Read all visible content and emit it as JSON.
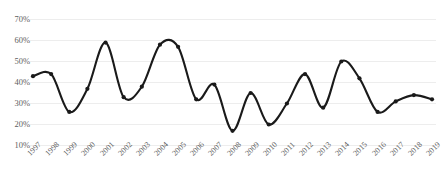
{
  "chart_data": {
    "type": "line",
    "title": "",
    "subtitle": "",
    "xlabel": "",
    "ylabel": "",
    "legend": [],
    "legend_position": "none",
    "grid": true,
    "grid_axis": "y",
    "marker": "circle",
    "line_style": "smooth",
    "line_color": "#1a1a1a",
    "marker_color": "#1a1a1a",
    "grid_color": "#ededed",
    "background_color": "#ffffff",
    "tick_label_color": "#606060",
    "ylim": [
      10,
      70
    ],
    "ytick_values": [
      10,
      20,
      30,
      40,
      50,
      60,
      70
    ],
    "ytick_labels": [
      "10%",
      "20%",
      "30%",
      "40%",
      "50%",
      "60%",
      "70%"
    ],
    "xlabel_rotation": -45,
    "categories": [
      "1997",
      "1998",
      "1999",
      "2000",
      "2001",
      "2002",
      "2003",
      "2004",
      "2005",
      "2006",
      "2007",
      "2008",
      "2009",
      "2010",
      "2011",
      "2012",
      "2013",
      "2014",
      "2015",
      "2016",
      "2017",
      "2018",
      "2019"
    ],
    "x": [
      1997,
      1998,
      1999,
      2000,
      2001,
      2002,
      2003,
      2004,
      2005,
      2006,
      2007,
      2008,
      2009,
      2010,
      2011,
      2012,
      2013,
      2014,
      2015,
      2016,
      2017,
      2018,
      2019
    ],
    "values": [
      43,
      44,
      26,
      37,
      59,
      33,
      38,
      58,
      57,
      32,
      39,
      17,
      35,
      20,
      30,
      44,
      28,
      50,
      42,
      26,
      31,
      34,
      32
    ],
    "units": "percent"
  }
}
